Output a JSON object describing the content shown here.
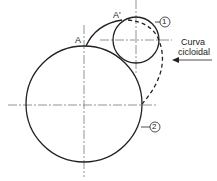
{
  "diagram": {
    "labels": {
      "point_a": "A",
      "point_a_prime": "A'",
      "circle_small": "1",
      "circle_big": "2",
      "curve_line1": "Curva",
      "curve_line2": "cicloidal"
    },
    "colors": {
      "stroke": "#222222",
      "background": "#ffffff"
    }
  }
}
